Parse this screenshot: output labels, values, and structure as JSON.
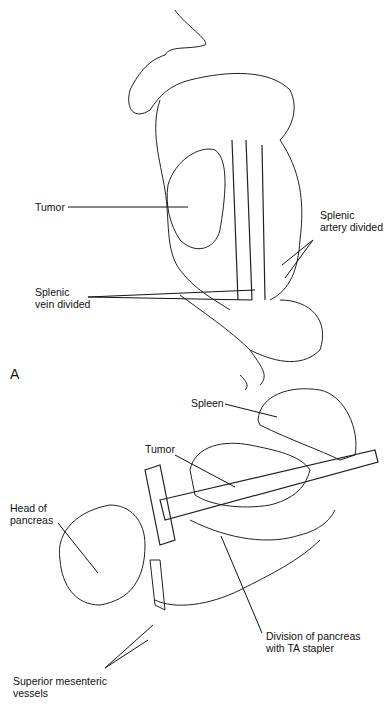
{
  "figure": {
    "panel_a": {
      "letter": "A",
      "labels": {
        "tumor": "Tumor",
        "splenic_artery": "Splenic\nartery divided",
        "splenic_vein": "Splenic\nvein divided"
      }
    },
    "panel_b": {
      "labels": {
        "spleen": "Spleen",
        "tumor": "Tumor",
        "head_of_pancreas": "Head of\npancreas",
        "division": "Division of pancreas\nwith TA stapler",
        "sm_vessels": "Superior mesenteric\nvessels"
      }
    }
  }
}
